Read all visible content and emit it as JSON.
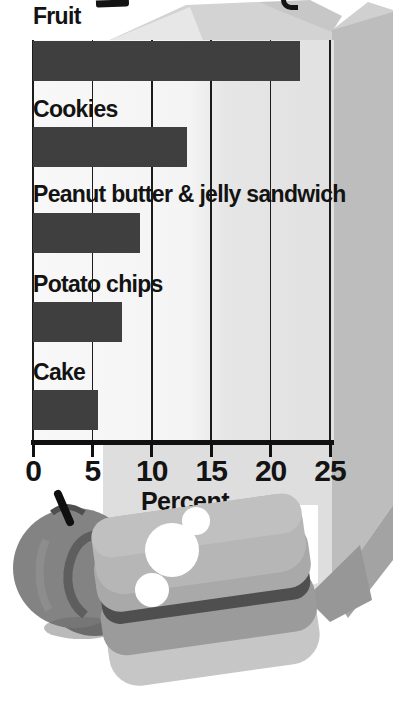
{
  "page": {
    "background": "#ffffff"
  },
  "chart_data": {
    "type": "bar",
    "orientation": "horizontal",
    "title": "",
    "categories": [
      "Fruit",
      "Cookies",
      "Peanut butter & jelly sandwich",
      "Potato chips",
      "Cake"
    ],
    "values": [
      22.5,
      13,
      9,
      7.5,
      5.5
    ],
    "xlabel": "Percent",
    "ylabel": "",
    "x_ticks": [
      0,
      5,
      10,
      15,
      20,
      25
    ],
    "xlim": [
      0,
      25
    ],
    "grid": true,
    "legend": false,
    "bar_color": "#3f3f3f",
    "gridline_color": "#1c1c1c",
    "text_color": "#131313"
  },
  "illustration": {
    "items": [
      "paper-lunch-bag",
      "apple",
      "sandwich-with-bite"
    ],
    "bag_color": "#dcdcdc",
    "bag_side_color": "#bdbdbd",
    "apple_color": "#828282",
    "sandwich_color": "#b3b3b3"
  }
}
